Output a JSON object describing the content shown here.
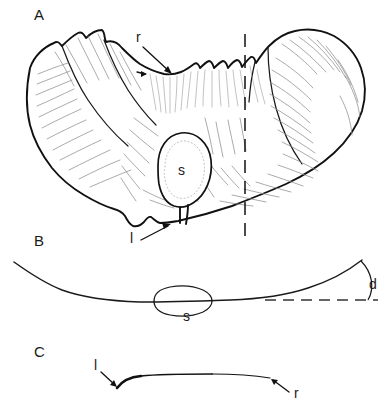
{
  "figure": {
    "background_color": "#ffffff",
    "ink_color": "#111111",
    "texture_color": "#8d8d8d",
    "width": 389,
    "height": 414,
    "caption_style": "scientific line drawing, three panels"
  },
  "panels": [
    {
      "id": "A",
      "letter": "A",
      "letter_x": 34,
      "letter_y": 20,
      "description": "dorsal view of valve with scalloped upper margin, radiating texture, central scar and vertical section plane",
      "annotations": [
        {
          "id": "r",
          "label": "r",
          "label_x": 136,
          "label_y": 42,
          "points_to": "dorsal ridge on upper margin",
          "arrow_from": [
            143,
            47
          ],
          "arrow_to": [
            172,
            74
          ]
        },
        {
          "id": "l",
          "label": "l",
          "label_x": 130,
          "label_y": 243,
          "points_to": "ventral lip of valve margin",
          "arrow_from": [
            141,
            240
          ],
          "arrow_to": [
            170,
            224
          ]
        },
        {
          "id": "s",
          "label": "s",
          "label_x": 178,
          "label_y": 175,
          "points_to": "central muscle scar",
          "arrow_from": null,
          "arrow_to": null
        }
      ],
      "section_plane": {
        "name": "section-plane-dashed",
        "x": 245,
        "y_top": 34,
        "y_bottom": 244,
        "style": "dashed vertical"
      }
    },
    {
      "id": "B",
      "letter": "B",
      "letter_x": 34,
      "letter_y": 246,
      "description": "transverse profile through section plane showing shell curvature, scar in section and divergence angle",
      "annotations": [
        {
          "id": "s",
          "label": "s",
          "label_x": 183,
          "label_y": 321,
          "points_to": "scar seen in section",
          "arrow_from": null,
          "arrow_to": null
        },
        {
          "id": "d",
          "label": "d",
          "label_x": 369,
          "label_y": 289,
          "points_to": "divergence angle between shell margin and horizontal reference",
          "arrow_from": null,
          "arrow_to": null
        }
      ],
      "reference_line": {
        "name": "horizontal-reference-dashed",
        "x_start": 265,
        "x_end": 378,
        "y": 300,
        "style": "dashed horizontal"
      }
    },
    {
      "id": "C",
      "letter": "C",
      "letter_x": 34,
      "letter_y": 357,
      "description": "thin longitudinal profile tapering from thick left tip to thin right tip",
      "annotations": [
        {
          "id": "l",
          "label": "l",
          "label_x": 94,
          "label_y": 370,
          "points_to": "thickened left tip",
          "arrow_from": [
            101,
            372
          ],
          "arrow_to": [
            117,
            387
          ]
        },
        {
          "id": "r",
          "label": "r",
          "label_x": 294,
          "label_y": 398,
          "points_to": "tapering right tip",
          "arrow_from": [
            289,
            392
          ],
          "arrow_to": [
            271,
            379
          ]
        }
      ]
    }
  ],
  "legend_keys": [
    {
      "symbol": "r",
      "meaning": "ridge"
    },
    {
      "symbol": "l",
      "meaning": "lip"
    },
    {
      "symbol": "s",
      "meaning": "scar"
    },
    {
      "symbol": "d",
      "meaning": "divergence angle"
    }
  ]
}
